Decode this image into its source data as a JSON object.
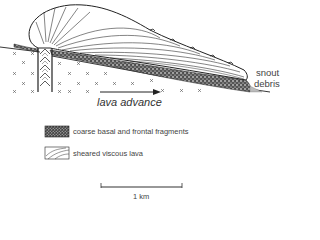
{
  "figure": {
    "type": "geological cross-section"
  },
  "labels": {
    "flow_direction": "lava advance",
    "snout_line1": "snout",
    "snout_line2": "debris"
  },
  "legend": {
    "items": [
      {
        "pattern": "coarse-stipple",
        "label": "coarse basal and frontal fragments"
      },
      {
        "pattern": "curved-shear-lines",
        "label": "sheared viscous lava"
      }
    ]
  },
  "scale_bar": {
    "label": "1 km"
  },
  "colors": {
    "ink": "#222222",
    "text": "#444444",
    "background": "#ffffff"
  }
}
